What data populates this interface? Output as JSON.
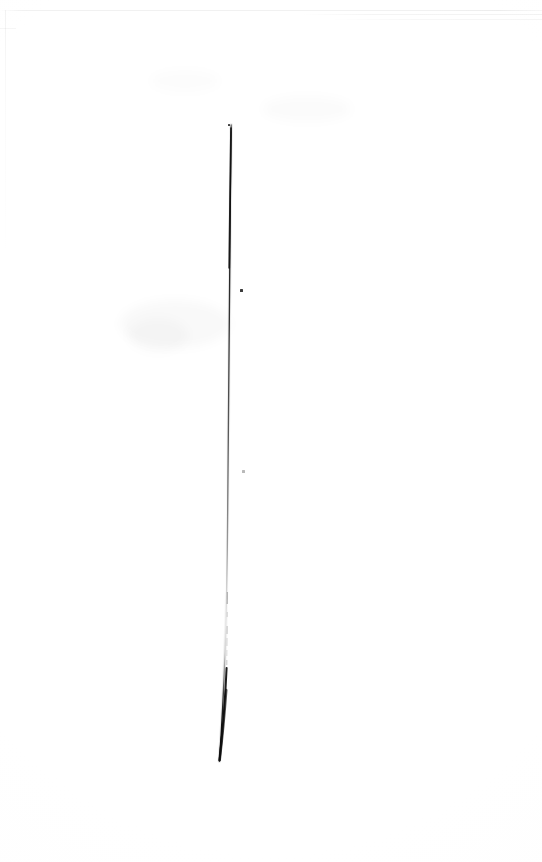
{
  "document": {
    "type": "scanned-page",
    "page_label": "",
    "visible_text": "",
    "description": "Blank scanned page with a single near-vertical dark rule",
    "width_px": 542,
    "height_px": 862
  },
  "colors": {
    "page_background": "#ffffff",
    "rule_dark": "#1a1a1a",
    "rule_mid": "#555555",
    "rule_faint": "#c9c9c9",
    "speck": "#3b3b3b",
    "edge_gray": "#ececec"
  },
  "artifacts": {
    "vertical_rule": {
      "name": "vertical-rule",
      "top_y": 125,
      "bottom_y": 761,
      "top_x": 231,
      "bottom_x": 219,
      "max_width_px": 3,
      "min_width_px": 1,
      "notes": "Dark at top, fades to near-invisible dashes around y 595-665, thickens and darkens again toward the bottom terminus"
    },
    "specks": [
      {
        "name": "speck-upper",
        "x": 240,
        "y": 289,
        "w": 3,
        "h": 3,
        "tone": "dark"
      },
      {
        "name": "speck-mid",
        "x": 242,
        "y": 470,
        "w": 3,
        "h": 3,
        "tone": "faint"
      },
      {
        "name": "speck-top-right",
        "x": 228,
        "y": 124,
        "w": 2,
        "h": 2,
        "tone": "dark"
      }
    ],
    "smudges": [
      {
        "name": "smudge-upper-right",
        "x": 262,
        "y": 96,
        "w": 90,
        "h": 26
      },
      {
        "name": "smudge-left-mid",
        "x": 120,
        "y": 300,
        "w": 110,
        "h": 48
      },
      {
        "name": "smudge-upper-left",
        "x": 150,
        "y": 70,
        "w": 70,
        "h": 22
      }
    ]
  }
}
